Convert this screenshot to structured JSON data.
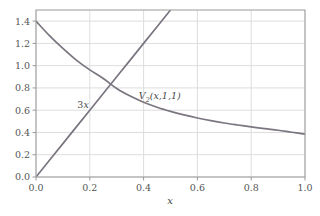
{
  "chart_data": {
    "type": "line",
    "title": "",
    "subtitle": "",
    "xlabel": "x",
    "ylabel": "",
    "xlim": [
      0.0,
      1.0
    ],
    "ylim": [
      0.0,
      1.5
    ],
    "grid": true,
    "legend_position": "inline-annotation",
    "xticks": [
      0.0,
      0.2,
      0.4,
      0.6,
      0.8,
      1.0
    ],
    "xtick_labels": [
      "0.0",
      "0.2",
      "0.4",
      "0.6",
      "0.8",
      "1.0"
    ],
    "yticks": [
      0.0,
      0.2,
      0.4,
      0.6,
      0.8,
      1.0,
      1.2,
      1.4
    ],
    "ytick_labels": [
      "0.0",
      "0.2",
      "0.4",
      "0.6",
      "0.8",
      "1.0",
      "1.2",
      "1.4"
    ],
    "line_color": "#7b7580",
    "grid_color": "#dddddd",
    "frame_color": "#9a9a9a",
    "background": "#ffffff",
    "annotations": [
      {
        "name": "linear-curve-label",
        "text": "3x",
        "text_main": "3",
        "text_italic": "x",
        "x": 0.175,
        "y": 0.62
      },
      {
        "name": "decay-curve-label",
        "text": "V2(x,1,1)",
        "symbol": "V",
        "subscript": "2",
        "args": "(x,1,1)",
        "x": 0.46,
        "y": 0.7
      }
    ],
    "intersection": {
      "x": 0.275,
      "y": 0.82
    },
    "series": [
      {
        "name": "3x",
        "label": "3x",
        "color": "#7b7580",
        "x": [
          0.0,
          0.05,
          0.1,
          0.15,
          0.2,
          0.25,
          0.3,
          0.35,
          0.4,
          0.45,
          0.5
        ],
        "values": [
          0.0,
          0.15,
          0.3,
          0.45,
          0.6,
          0.75,
          0.9,
          1.05,
          1.2,
          1.35,
          1.5
        ]
      },
      {
        "name": "V2(x,1,1)",
        "label": "V2(x,1,1)",
        "color": "#7b7580",
        "x": [
          0.0,
          0.05,
          0.1,
          0.15,
          0.2,
          0.25,
          0.3,
          0.35,
          0.4,
          0.45,
          0.5,
          0.55,
          0.6,
          0.65,
          0.7,
          0.75,
          0.8,
          0.85,
          0.9,
          0.95,
          1.0
        ],
        "values": [
          1.4,
          1.27,
          1.155,
          1.05,
          0.962,
          0.885,
          0.795,
          0.727,
          0.672,
          0.627,
          0.59,
          0.558,
          0.53,
          0.506,
          0.485,
          0.467,
          0.45,
          0.434,
          0.42,
          0.402,
          0.385
        ]
      }
    ]
  }
}
